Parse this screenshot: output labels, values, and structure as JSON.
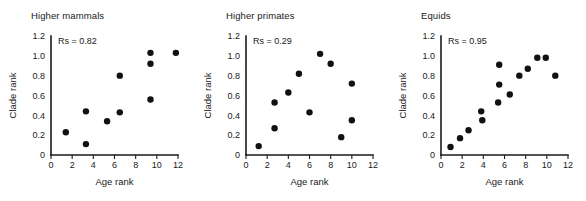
{
  "figure": {
    "background": "#ffffff",
    "marker_color": "#111111",
    "axis_color": "#1a1a1a",
    "panel_count": 3
  },
  "chart_data": [
    {
      "type": "scatter",
      "title": "Higher mammals",
      "xlabel": "Age rank",
      "ylabel": "Clade rank",
      "xlim": [
        0,
        12
      ],
      "ylim": [
        0,
        1.2
      ],
      "xticks": [
        "0",
        "2",
        "4",
        "6",
        "8",
        "10",
        "12"
      ],
      "xtick_values": [
        0,
        2,
        4,
        6,
        8,
        10,
        12
      ],
      "yticks": [
        "0",
        "0.2",
        "0.4",
        "0.6",
        "0.8",
        "1.0",
        "1.2"
      ],
      "ytick_values": [
        0,
        0.2,
        0.4,
        0.6,
        0.8,
        1.0,
        1.2
      ],
      "grid": false,
      "legend": "none",
      "annotation": "Rs = 0.82",
      "annotation_label": "Rs",
      "annotation_value": 0.82,
      "points": [
        {
          "x": 1.4,
          "y": 0.23
        },
        {
          "x": 3.3,
          "y": 0.11
        },
        {
          "x": 3.3,
          "y": 0.44
        },
        {
          "x": 5.3,
          "y": 0.34
        },
        {
          "x": 6.5,
          "y": 0.43
        },
        {
          "x": 6.5,
          "y": 0.8
        },
        {
          "x": 9.4,
          "y": 0.56
        },
        {
          "x": 9.4,
          "y": 0.92
        },
        {
          "x": 9.4,
          "y": 1.03
        },
        {
          "x": 11.8,
          "y": 1.03
        }
      ]
    },
    {
      "type": "scatter",
      "title": "Higher primates",
      "xlabel": "Age rank",
      "ylabel": "Clade rank",
      "xlim": [
        0,
        12
      ],
      "ylim": [
        0,
        1.2
      ],
      "xticks": [
        "0",
        "2",
        "4",
        "6",
        "8",
        "10",
        "12"
      ],
      "xtick_values": [
        0,
        2,
        4,
        6,
        8,
        10,
        12
      ],
      "yticks": [
        "0",
        "0.2",
        "0.4",
        "0.6",
        "0.8",
        "1.0",
        "1.2"
      ],
      "ytick_values": [
        0,
        0.2,
        0.4,
        0.6,
        0.8,
        1.0,
        1.2
      ],
      "grid": false,
      "legend": "none",
      "annotation": "Rs = 0.29",
      "annotation_label": "Rs",
      "annotation_value": 0.29,
      "points": [
        {
          "x": 1.2,
          "y": 0.09
        },
        {
          "x": 2.7,
          "y": 0.27
        },
        {
          "x": 2.7,
          "y": 0.53
        },
        {
          "x": 4.0,
          "y": 0.63
        },
        {
          "x": 5.0,
          "y": 0.82
        },
        {
          "x": 6.0,
          "y": 0.43
        },
        {
          "x": 7.0,
          "y": 1.02
        },
        {
          "x": 8.0,
          "y": 0.92
        },
        {
          "x": 9.0,
          "y": 0.18
        },
        {
          "x": 10.0,
          "y": 0.35
        },
        {
          "x": 10.0,
          "y": 0.72
        }
      ]
    },
    {
      "type": "scatter",
      "title": "Equids",
      "xlabel": "Age rank",
      "ylabel": "Clade rank",
      "xlim": [
        0,
        12
      ],
      "ylim": [
        0,
        1.2
      ],
      "xticks": [
        "0",
        "2",
        "4",
        "6",
        "8",
        "10",
        "12"
      ],
      "xtick_values": [
        0,
        2,
        4,
        6,
        8,
        10,
        12
      ],
      "yticks": [
        "0",
        "0.2",
        "0.4",
        "0.6",
        "0.8",
        "1.0",
        "1.2"
      ],
      "ytick_values": [
        0,
        0.2,
        0.4,
        0.6,
        0.8,
        1.0,
        1.2
      ],
      "grid": false,
      "legend": "none",
      "annotation": "Rs = 0.95",
      "annotation_label": "Rs",
      "annotation_value": 0.95,
      "points": [
        {
          "x": 0.9,
          "y": 0.08
        },
        {
          "x": 1.8,
          "y": 0.17
        },
        {
          "x": 2.6,
          "y": 0.25
        },
        {
          "x": 3.8,
          "y": 0.44
        },
        {
          "x": 3.9,
          "y": 0.35
        },
        {
          "x": 5.4,
          "y": 0.53
        },
        {
          "x": 5.5,
          "y": 0.71
        },
        {
          "x": 5.5,
          "y": 0.91
        },
        {
          "x": 6.5,
          "y": 0.61
        },
        {
          "x": 7.4,
          "y": 0.8
        },
        {
          "x": 8.2,
          "y": 0.87
        },
        {
          "x": 9.1,
          "y": 0.98
        },
        {
          "x": 9.9,
          "y": 0.98
        },
        {
          "x": 10.8,
          "y": 0.8
        }
      ]
    }
  ]
}
